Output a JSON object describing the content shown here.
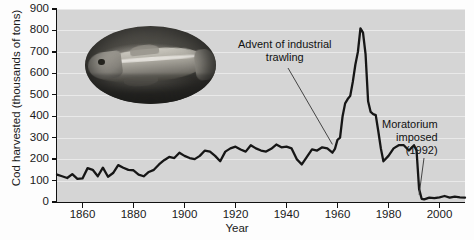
{
  "chart_data": {
    "type": "line",
    "title": "",
    "subtitle": "",
    "xlabel": "Year",
    "ylabel": "Cod harvested (thousands of tons)",
    "xlim": [
      1850,
      2010
    ],
    "ylim": [
      0,
      900
    ],
    "xticks": [
      1860,
      1880,
      1900,
      1920,
      1940,
      1960,
      1980,
      2000
    ],
    "xtick_labels": [
      "1860",
      "1880",
      "1900",
      "1920",
      "1940",
      "1960",
      "1980",
      "2000"
    ],
    "yticks": [
      0,
      100,
      200,
      300,
      400,
      500,
      600,
      700,
      800,
      900
    ],
    "ytick_labels": [
      "0",
      "100",
      "200",
      "300",
      "400",
      "500",
      "600",
      "700",
      "800",
      "900"
    ],
    "grid": true,
    "grid_axis": "y",
    "legend": false,
    "line_color": "#1a1a1a",
    "plot_background": "#d5d5d5",
    "series": [
      {
        "name": "Cod harvested",
        "units": "thousands of tons",
        "x": [
          1850,
          1852,
          1854,
          1856,
          1858,
          1860,
          1862,
          1864,
          1866,
          1868,
          1870,
          1872,
          1874,
          1876,
          1878,
          1880,
          1882,
          1884,
          1886,
          1888,
          1890,
          1892,
          1894,
          1896,
          1898,
          1900,
          1902,
          1904,
          1906,
          1908,
          1910,
          1912,
          1914,
          1916,
          1918,
          1920,
          1922,
          1924,
          1926,
          1928,
          1930,
          1932,
          1934,
          1936,
          1938,
          1940,
          1942,
          1944,
          1946,
          1948,
          1950,
          1952,
          1954,
          1956,
          1958,
          1959,
          1960,
          1961,
          1962,
          1963,
          1964,
          1965,
          1966,
          1967,
          1968,
          1969,
          1970,
          1971,
          1972,
          1973,
          1974,
          1975,
          1976,
          1977,
          1978,
          1980,
          1982,
          1984,
          1986,
          1988,
          1990,
          1991,
          1992,
          1993,
          1994,
          1996,
          1998,
          2000,
          2002,
          2004,
          2006,
          2008,
          2010
        ],
        "y": [
          128,
          120,
          112,
          130,
          108,
          110,
          158,
          150,
          120,
          160,
          118,
          135,
          172,
          160,
          150,
          148,
          128,
          120,
          140,
          150,
          175,
          195,
          210,
          205,
          230,
          215,
          205,
          200,
          215,
          240,
          235,
          215,
          190,
          235,
          250,
          258,
          245,
          235,
          265,
          250,
          240,
          235,
          248,
          268,
          255,
          258,
          250,
          200,
          175,
          210,
          245,
          240,
          255,
          250,
          230,
          248,
          290,
          300,
          400,
          460,
          480,
          495,
          560,
          640,
          700,
          810,
          790,
          690,
          470,
          420,
          410,
          405,
          330,
          250,
          190,
          215,
          250,
          265,
          265,
          240,
          265,
          240,
          60,
          15,
          12,
          20,
          18,
          22,
          28,
          20,
          25,
          22,
          20
        ]
      }
    ],
    "annotations": [
      {
        "id": "advent-of-industrial-trawling",
        "text_line1": "Advent of industrial",
        "text_line2": "trawling",
        "points_to_year": 1958,
        "points_to_value": 250
      },
      {
        "id": "moratorium-imposed",
        "text_line1": "Moratorium",
        "text_line2": "imposed",
        "text_line3": "(1992)",
        "points_to_year": 1992,
        "points_to_value": 20
      }
    ],
    "inset_image": {
      "name": "atlantic-cod-photograph",
      "shape": "oval",
      "description": "Grayscale photograph of an Atlantic cod"
    }
  }
}
